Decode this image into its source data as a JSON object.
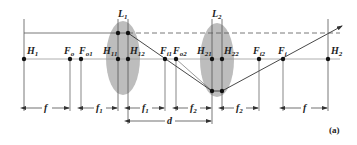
{
  "figure": {
    "caption": "(a)",
    "lenses": [
      {
        "name": "L",
        "sub": "1"
      },
      {
        "name": "L",
        "sub": "2"
      }
    ],
    "points": [
      {
        "name": "H",
        "sub": "1"
      },
      {
        "name": "F",
        "sub": "o"
      },
      {
        "name": "F",
        "sub": "o1"
      },
      {
        "name": "H",
        "sub": "11"
      },
      {
        "name": "H",
        "sub": "12"
      },
      {
        "name": "F",
        "sub": "i1"
      },
      {
        "name": "F",
        "sub": "o2"
      },
      {
        "name": "H",
        "sub": "21"
      },
      {
        "name": "H",
        "sub": "22"
      },
      {
        "name": "F",
        "sub": "i2"
      },
      {
        "name": "F",
        "sub": "i"
      },
      {
        "name": "H",
        "sub": "2"
      }
    ],
    "dimensions": [
      {
        "name": "f",
        "sub": ""
      },
      {
        "name": "f",
        "sub": "1"
      },
      {
        "name": "f",
        "sub": "1"
      },
      {
        "name": "f",
        "sub": "2"
      },
      {
        "name": "f",
        "sub": "2"
      },
      {
        "name": "f",
        "sub": ""
      },
      {
        "name": "d",
        "sub": ""
      }
    ],
    "colors": {
      "line": "#333333",
      "lens_fill": "#bdbdbd",
      "axis": "#999999"
    }
  }
}
